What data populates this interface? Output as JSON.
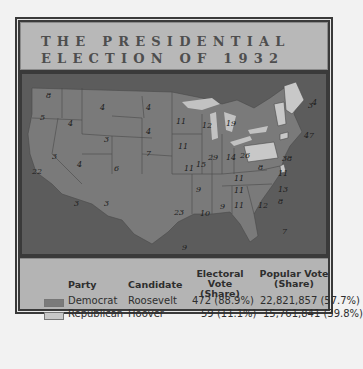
{
  "title": {
    "line1": "THE PRESIDENTIAL",
    "line2": "ELECTION OF 1932"
  },
  "colors": {
    "democrat": "#7a7a7a",
    "republican": "#c8c8c8",
    "water": "#5c5c5c",
    "lakes": "#c2c2c2"
  },
  "map": {
    "states": [
      {
        "name": "WA",
        "ev": "8"
      },
      {
        "name": "OR",
        "ev": "5"
      },
      {
        "name": "CA",
        "ev": "22"
      },
      {
        "name": "ID",
        "ev": "4"
      },
      {
        "name": "NV",
        "ev": "3"
      },
      {
        "name": "MT",
        "ev": "4"
      },
      {
        "name": "WY",
        "ev": "3"
      },
      {
        "name": "UT",
        "ev": "4"
      },
      {
        "name": "CO",
        "ev": "6"
      },
      {
        "name": "AZ",
        "ev": "3"
      },
      {
        "name": "NM",
        "ev": "3"
      },
      {
        "name": "ND",
        "ev": "4"
      },
      {
        "name": "SD",
        "ev": "4"
      },
      {
        "name": "NE",
        "ev": "7"
      },
      {
        "name": "KS",
        "ev": "9"
      },
      {
        "name": "OK",
        "ev": "11"
      },
      {
        "name": "TX",
        "ev": "23"
      },
      {
        "name": "MN",
        "ev": "11"
      },
      {
        "name": "IA",
        "ev": "11"
      },
      {
        "name": "MO",
        "ev": "15"
      },
      {
        "name": "AR",
        "ev": "9"
      },
      {
        "name": "LA",
        "ev": "10"
      },
      {
        "name": "WI",
        "ev": "12"
      },
      {
        "name": "IL",
        "ev": "29"
      },
      {
        "name": "MI",
        "ev": "19"
      },
      {
        "name": "IN",
        "ev": "14"
      },
      {
        "name": "OH",
        "ev": "26"
      },
      {
        "name": "KY",
        "ev": "11"
      },
      {
        "name": "TN",
        "ev": "11"
      },
      {
        "name": "MS",
        "ev": "9"
      },
      {
        "name": "AL",
        "ev": "11"
      },
      {
        "name": "GA",
        "ev": "12"
      },
      {
        "name": "FL",
        "ev": "7"
      },
      {
        "name": "SC",
        "ev": "8"
      },
      {
        "name": "NC",
        "ev": "13"
      },
      {
        "name": "VA",
        "ev": "11"
      },
      {
        "name": "WV",
        "ev": "8"
      },
      {
        "name": "PA",
        "ev": "38"
      },
      {
        "name": "NY",
        "ev": "47"
      },
      {
        "name": "VT",
        "ev": "3"
      },
      {
        "name": "NH",
        "ev": "4"
      },
      {
        "name": "ME",
        "ev": "5"
      },
      {
        "name": "MA",
        "ev": "17"
      },
      {
        "name": "RI",
        "ev": "4"
      },
      {
        "name": "CT",
        "ev": "8"
      },
      {
        "name": "NJ",
        "ev": "16"
      },
      {
        "name": "DE",
        "ev": "3"
      },
      {
        "name": "MD",
        "ev": "8"
      }
    ]
  },
  "legend": {
    "headers": {
      "party": "Party",
      "candidate": "Candidate",
      "electoral": "Electoral Vote\n(Share)",
      "popular": "Popular Vote\n(Share)"
    },
    "rows": [
      {
        "party": "Democrat",
        "candidate": "Roosevelt",
        "electoral": "472 (88.9%)",
        "popular": "22,821,857 (57.7%)"
      },
      {
        "party": "Republican",
        "candidate": "Hoover",
        "electoral": "59 (11.1%)",
        "popular": "15,761,841 (39.8%)"
      }
    ]
  }
}
